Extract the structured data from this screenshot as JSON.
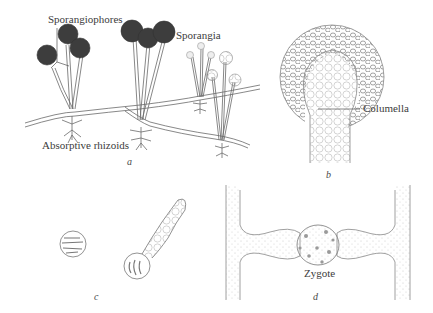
{
  "figure": {
    "panels": [
      {
        "id": "a",
        "label": "a",
        "annotations": [
          "Sporangiophores",
          "Sporangia",
          "Absorptive rhizoids"
        ]
      },
      {
        "id": "b",
        "label": "b",
        "annotations": [
          "Columella"
        ]
      },
      {
        "id": "c",
        "label": "c",
        "annotations": []
      },
      {
        "id": "d",
        "label": "d",
        "annotations": [
          "Zygote"
        ]
      }
    ],
    "labels": {
      "sporangiophores": "Sporangiophores",
      "sporangia": "Sporangia",
      "rhizoids": "Absorptive rhizoids",
      "columella": "Columella",
      "zygote": "Zygote"
    },
    "panel_letters": {
      "a": "a",
      "b": "b",
      "c": "c",
      "d": "d"
    },
    "colors": {
      "line": "#6a6a6a",
      "sporangium_fill": "#3d3d3d",
      "stipple": "#bdbdbd",
      "background": "#ffffff"
    }
  }
}
